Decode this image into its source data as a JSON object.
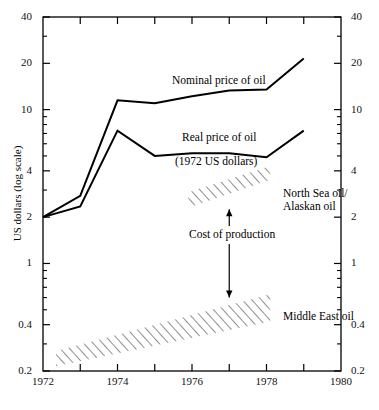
{
  "chart_data": {
    "type": "line",
    "title": "",
    "xlabel": "",
    "ylabel": "US dollars (log scale)",
    "yscale": "log",
    "xlim": [
      1972,
      1980
    ],
    "ylim": [
      0.2,
      40
    ],
    "grid": false,
    "legend_position": "inline-annotations",
    "x_ticks": [
      1972,
      1973,
      1974,
      1975,
      1976,
      1977,
      1978,
      1979,
      1980
    ],
    "x_tick_labels": [
      "1972",
      "",
      "1974",
      "",
      "1976",
      "",
      "1978",
      "",
      "1980"
    ],
    "y_ticks": [
      0.2,
      0.4,
      1,
      2,
      4,
      10,
      20,
      40
    ],
    "y_tick_labels": [
      "0.2",
      "0.4",
      "1",
      "2",
      "4",
      "10",
      "20",
      "40"
    ],
    "y_minor_ticks": [
      0.3,
      0.5,
      0.6,
      0.7,
      0.8,
      0.9,
      3,
      5,
      6,
      7,
      8,
      9,
      30
    ],
    "x": [
      1972,
      1973,
      1974,
      1975,
      1976,
      1977,
      1978,
      1979
    ],
    "series": [
      {
        "name": "Nominal price of oil",
        "values": [
          2.0,
          2.75,
          11.5,
          11.0,
          12.2,
          13.3,
          13.5,
          21.5
        ]
      },
      {
        "name": "Real price of oil (1972 US dollars)",
        "values": [
          2.0,
          2.35,
          7.3,
          5.0,
          5.2,
          5.2,
          4.9,
          7.3
        ]
      }
    ],
    "bands": [
      {
        "name": "North Sea oil/ Alaskan oil",
        "label_line1": "North Sea oil/",
        "label_line2": "Alaskan oil",
        "x_start": 1975.9,
        "x_end": 1978.1,
        "y_start_low": 2.3,
        "y_start_high": 2.9,
        "y_end_low": 3.5,
        "y_end_high": 4.3,
        "hatch": "diagonal"
      },
      {
        "name": "Middle East oil",
        "label_line1": "Middle East oil",
        "label_line2": "",
        "x_start": 1972.35,
        "x_end": 1978.1,
        "y_start_low": 0.215,
        "y_start_high": 0.27,
        "y_end_low": 0.42,
        "y_end_high": 0.63,
        "hatch": "diagonal"
      }
    ],
    "annotations": [
      {
        "name": "cost-of-production",
        "text": "Cost of production",
        "x": 1977.0,
        "arrow_top_y": 2.25,
        "arrow_bottom_y": 0.6,
        "arrow_style": "double-headed-split"
      }
    ],
    "series_labels": [
      {
        "name": "nominal-price-label",
        "text": "Nominal price of oil"
      },
      {
        "name": "real-price-label",
        "text": "Real price of oil"
      },
      {
        "name": "real-price-sublabel",
        "text": "(1972 US dollars)"
      }
    ],
    "colors": {
      "line": "#000000",
      "axis": "#000000",
      "hatch": "#333333",
      "background": "#ffffff"
    }
  }
}
